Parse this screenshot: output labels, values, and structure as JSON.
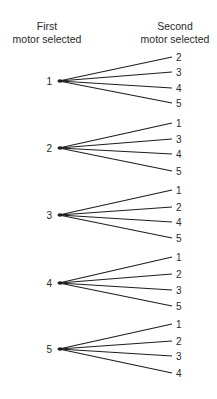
{
  "headers": {
    "first_line1": "First",
    "first_line2": "motor selected",
    "second_line1": "Second",
    "second_line2": "motor selected"
  },
  "tree": [
    {
      "first": "1",
      "y": 81,
      "seconds": [
        {
          "label": "2",
          "y": 57
        },
        {
          "label": "3",
          "y": 72
        },
        {
          "label": "4",
          "y": 88
        },
        {
          "label": "5",
          "y": 103
        }
      ]
    },
    {
      "first": "2",
      "y": 148,
      "seconds": [
        {
          "label": "1",
          "y": 123
        },
        {
          "label": "3",
          "y": 139
        },
        {
          "label": "4",
          "y": 154
        },
        {
          "label": "5",
          "y": 171
        }
      ]
    },
    {
      "first": "3",
      "y": 215,
      "seconds": [
        {
          "label": "1",
          "y": 190
        },
        {
          "label": "2",
          "y": 207
        },
        {
          "label": "4",
          "y": 222
        },
        {
          "label": "5",
          "y": 238
        }
      ]
    },
    {
      "first": "4",
      "y": 283,
      "seconds": [
        {
          "label": "1",
          "y": 257
        },
        {
          "label": "2",
          "y": 274
        },
        {
          "label": "3",
          "y": 290
        },
        {
          "label": "5",
          "y": 306
        }
      ]
    },
    {
      "first": "5",
      "y": 349,
      "seconds": [
        {
          "label": "1",
          "y": 324
        },
        {
          "label": "2",
          "y": 341
        },
        {
          "label": "3",
          "y": 356
        },
        {
          "label": "4",
          "y": 373
        }
      ]
    }
  ],
  "layout": {
    "node_x": 59,
    "node_label_x": 52,
    "leaf_x": 172,
    "leaf_label_x": 176,
    "line_color": "#1e1e1e"
  }
}
